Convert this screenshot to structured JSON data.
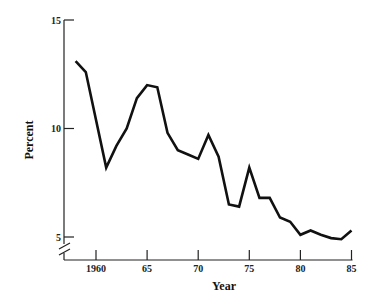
{
  "chart_data": {
    "type": "line",
    "title": "",
    "xlabel": "Year",
    "ylabel": "Percent",
    "xlim": [
      1957.5,
      1985.2
    ],
    "ylim": [
      5,
      15
    ],
    "y_axis_break": true,
    "grid": false,
    "legend": null,
    "x_ticks": [
      {
        "value": 1960,
        "label": "1960"
      },
      {
        "value": 1965,
        "label": "65"
      },
      {
        "value": 1970,
        "label": "70"
      },
      {
        "value": 1975,
        "label": "75"
      },
      {
        "value": 1980,
        "label": "80"
      },
      {
        "value": 1985,
        "label": "85"
      }
    ],
    "y_ticks": [
      {
        "value": 15,
        "label": "15"
      },
      {
        "value": 10,
        "label": "10"
      },
      {
        "value": 5,
        "label": "5"
      }
    ],
    "series": [
      {
        "name": "Percent",
        "color": "#111111",
        "x": [
          1958,
          1959,
          1961,
          1962,
          1963,
          1964,
          1965,
          1966,
          1967,
          1968,
          1969,
          1970,
          1971,
          1972,
          1973,
          1974,
          1975,
          1976,
          1977,
          1978,
          1979,
          1980,
          1981,
          1982,
          1983,
          1984,
          1985
        ],
        "y": [
          13.1,
          12.6,
          8.2,
          9.2,
          10.0,
          11.4,
          12.0,
          11.9,
          9.8,
          9.0,
          8.8,
          8.6,
          9.7,
          8.7,
          6.5,
          6.4,
          8.2,
          6.8,
          6.8,
          5.9,
          5.7,
          5.1,
          5.3,
          5.1,
          4.95,
          4.9,
          5.3
        ]
      }
    ]
  }
}
